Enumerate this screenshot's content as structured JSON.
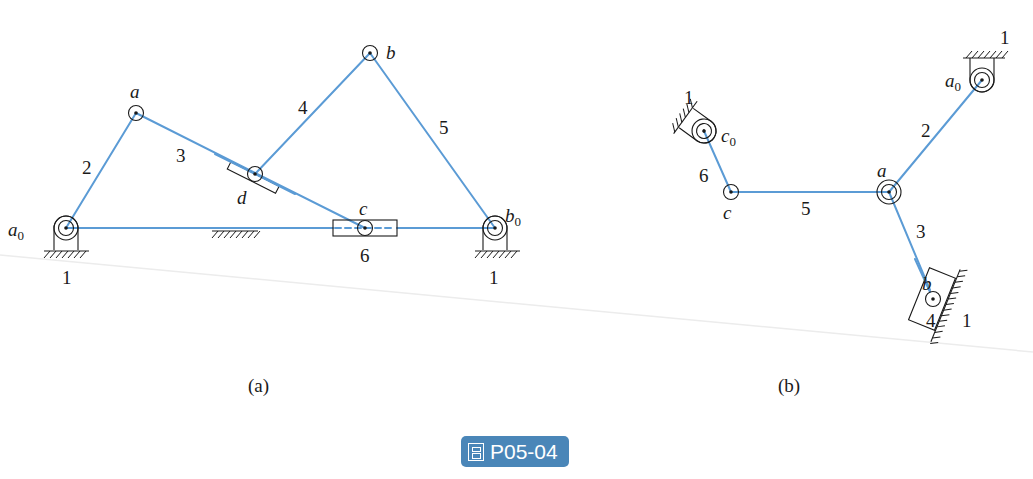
{
  "figure": {
    "caption_badge": "P05-04",
    "badge_icon": "figure-icon",
    "badge_color": "#4a86b8",
    "link_color": "#5b9bd5"
  },
  "panel_a": {
    "caption": "(a)",
    "joints": {
      "a0": "a",
      "a": "a",
      "b": "b",
      "b0": "b",
      "c": "c",
      "d": "d"
    },
    "joint_subscripts": {
      "a0": "0",
      "b0": "0"
    },
    "link_numbers": {
      "l2": "2",
      "l3": "3",
      "l4": "4",
      "l5": "5",
      "l6": "6"
    },
    "ground_labels": [
      "1",
      "1"
    ]
  },
  "panel_b": {
    "caption": "(b)",
    "joints": {
      "a0": "a",
      "a": "a",
      "b": "b",
      "c": "c",
      "c0": "c"
    },
    "joint_subscripts": {
      "a0": "0",
      "c0": "0"
    },
    "link_numbers": {
      "l2": "2",
      "l3": "3",
      "l4": "4",
      "l5": "5",
      "l6": "6"
    },
    "ground_labels": [
      "1",
      "1",
      "1"
    ]
  }
}
